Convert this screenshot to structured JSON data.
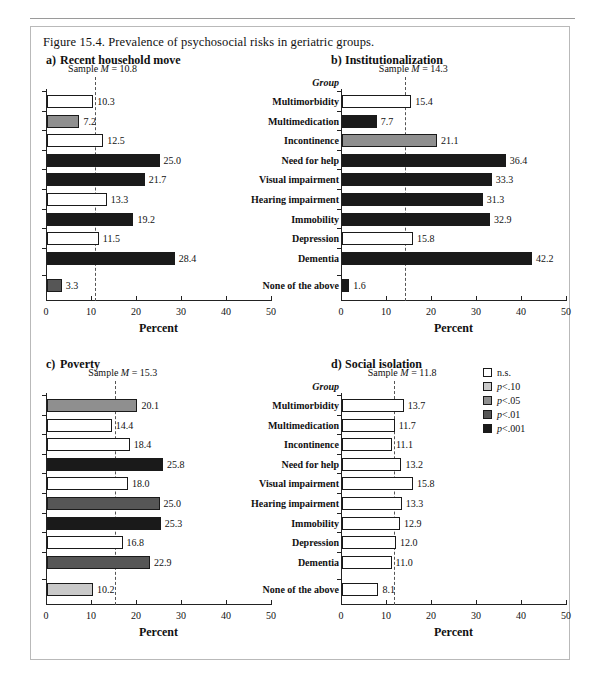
{
  "figure": {
    "caption": "Figure 15.4. Prevalence of psychosocial risks in geriatric groups.",
    "xaxis_title": "Percent",
    "group_header": "Group",
    "axis_ticks": [
      "0",
      "10",
      "20",
      "30",
      "40",
      "50"
    ],
    "axis_min": 0,
    "axis_max": 50,
    "categories": [
      "Multimorbidity",
      "Multimedication",
      "Incontinence",
      "Need for help",
      "Visual impairment",
      "Hearing impairment",
      "Immobility",
      "Depression",
      "Dementia",
      "None of the above"
    ]
  },
  "legend": {
    "items": [
      {
        "label": "n.s.",
        "label_italic": "",
        "label_rest": "n.s.",
        "color": "#ffffff"
      },
      {
        "label": "p<.10",
        "label_italic": "p",
        "label_rest": "<.10",
        "color": "#c9c9c9"
      },
      {
        "label": "p<.05",
        "label_italic": "p",
        "label_rest": "<.05",
        "color": "#8f8f8f"
      },
      {
        "label": "p<.01",
        "label_italic": "p",
        "label_rest": "<.01",
        "color": "#565656"
      },
      {
        "label": "p<.001",
        "label_italic": "p",
        "label_rest": "<.001",
        "color": "#1a1a1a"
      }
    ]
  },
  "chart_data": [
    {
      "type": "bar",
      "panel": "a",
      "panel_letter": "a)",
      "title": "Recent household move",
      "mean_label": "Sample M = 10.8",
      "mean_prefix": "Sample ",
      "mean_italic": "M",
      "mean_suffix": " = 10.8",
      "mean_value": 10.8,
      "xlabel": "Percent",
      "ylabel": "",
      "xlim": [
        0,
        50
      ],
      "categories": [
        "Multimorbidity",
        "Multimedication",
        "Incontinence",
        "Need for help",
        "Visual impairment",
        "Hearing impairment",
        "Immobility",
        "Depression",
        "Dementia",
        "None of the above"
      ],
      "values": [
        10.3,
        7.2,
        12.5,
        25.0,
        21.7,
        13.3,
        19.2,
        11.5,
        28.4,
        3.3
      ],
      "labels": [
        "10.3",
        "7.2",
        "12.5",
        "25.0",
        "21.7",
        "13.3",
        "19.2",
        "11.5",
        "28.4",
        "3.3"
      ],
      "significance": [
        "n.s.",
        "p<.05",
        "n.s.",
        "p<.001",
        "p<.001",
        "n.s.",
        "p<.001",
        "n.s.",
        "p<.001",
        "p<.01"
      ],
      "fills": [
        "#ffffff",
        "#8f8f8f",
        "#ffffff",
        "#1a1a1a",
        "#1a1a1a",
        "#ffffff",
        "#1a1a1a",
        "#ffffff",
        "#1a1a1a",
        "#565656"
      ]
    },
    {
      "type": "bar",
      "panel": "b",
      "panel_letter": "b)",
      "title": "Institutionalization",
      "mean_label": "Sample M = 14.3",
      "mean_prefix": "Sample ",
      "mean_italic": "M",
      "mean_suffix": " = 14.3",
      "mean_value": 14.3,
      "xlabel": "Percent",
      "ylabel": "",
      "xlim": [
        0,
        50
      ],
      "categories": [
        "Multimorbidity",
        "Multimedication",
        "Incontinence",
        "Need for help",
        "Visual impairment",
        "Hearing impairment",
        "Immobility",
        "Depression",
        "Dementia",
        "None of the above"
      ],
      "values": [
        15.4,
        7.7,
        21.1,
        36.4,
        33.3,
        31.3,
        32.9,
        15.8,
        42.2,
        1.6
      ],
      "labels": [
        "15.4",
        "7.7",
        "21.1",
        "36.4",
        "33.3",
        "31.3",
        "32.9",
        "15.8",
        "42.2",
        "1.6"
      ],
      "significance": [
        "n.s.",
        "p<.001",
        "p<.05",
        "p<.001",
        "p<.001",
        "p<.001",
        "p<.001",
        "n.s.",
        "p<.001",
        "p<.001"
      ],
      "fills": [
        "#ffffff",
        "#1a1a1a",
        "#8f8f8f",
        "#1a1a1a",
        "#1a1a1a",
        "#1a1a1a",
        "#1a1a1a",
        "#ffffff",
        "#1a1a1a",
        "#1a1a1a"
      ]
    },
    {
      "type": "bar",
      "panel": "c",
      "panel_letter": "c)",
      "title": "Poverty",
      "mean_label": "Sample M = 15.3",
      "mean_prefix": "Sample ",
      "mean_italic": "M",
      "mean_suffix": " = 15.3",
      "mean_value": 15.3,
      "xlabel": "Percent",
      "ylabel": "",
      "xlim": [
        0,
        50
      ],
      "categories": [
        "Multimorbidity",
        "Multimedication",
        "Incontinence",
        "Need for help",
        "Visual impairment",
        "Hearing impairment",
        "Immobility",
        "Depression",
        "Dementia",
        "None of the above"
      ],
      "values": [
        20.1,
        14.4,
        18.4,
        25.8,
        18.0,
        25.0,
        25.3,
        16.8,
        22.9,
        10.2
      ],
      "labels": [
        "20.1",
        "14.4",
        "18.4",
        "25.8",
        "18.0",
        "25.0",
        "25.3",
        "16.8",
        "22.9",
        "10.2"
      ],
      "significance": [
        "p<.05",
        "n.s.",
        "n.s.",
        "p<.001",
        "n.s.",
        "p<.01",
        "p<.001",
        "n.s.",
        "p<.01",
        "p<.10"
      ],
      "fills": [
        "#8f8f8f",
        "#ffffff",
        "#ffffff",
        "#1a1a1a",
        "#ffffff",
        "#565656",
        "#1a1a1a",
        "#ffffff",
        "#565656",
        "#c9c9c9"
      ]
    },
    {
      "type": "bar",
      "panel": "d",
      "panel_letter": "d)",
      "title": "Social isolation",
      "mean_label": "Sample M = 11.8",
      "mean_prefix": "Sample ",
      "mean_italic": "M",
      "mean_suffix": " = 11.8",
      "mean_value": 11.8,
      "xlabel": "Percent",
      "ylabel": "",
      "xlim": [
        0,
        50
      ],
      "categories": [
        "Multimorbidity",
        "Multimedication",
        "Incontinence",
        "Need for help",
        "Visual impairment",
        "Hearing impairment",
        "Immobility",
        "Depression",
        "Dementia",
        "None of the above"
      ],
      "values": [
        13.7,
        11.7,
        11.1,
        13.2,
        15.8,
        13.3,
        12.9,
        12.0,
        11.0,
        8.1
      ],
      "labels": [
        "13.7",
        "11.7",
        "11.1",
        "13.2",
        "15.8",
        "13.3",
        "12.9",
        "12.0",
        "11.0",
        "8.1"
      ],
      "significance": [
        "n.s.",
        "n.s.",
        "n.s.",
        "n.s.",
        "n.s.",
        "n.s.",
        "n.s.",
        "n.s.",
        "n.s.",
        "n.s."
      ],
      "fills": [
        "#ffffff",
        "#ffffff",
        "#ffffff",
        "#ffffff",
        "#ffffff",
        "#ffffff",
        "#ffffff",
        "#ffffff",
        "#ffffff",
        "#ffffff"
      ]
    }
  ]
}
